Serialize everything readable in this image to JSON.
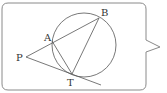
{
  "diagram": {
    "labels": {
      "A": "A",
      "B": "B",
      "P": "P",
      "T": "T"
    },
    "points": {
      "P": [
        26,
        57
      ],
      "A": [
        52,
        41
      ],
      "B": [
        99,
        18
      ],
      "T": [
        72,
        74
      ]
    },
    "circle": {
      "cx": 84,
      "cy": 45,
      "r": 32
    },
    "colors": {
      "stroke": "#555555",
      "box_border": "#888888",
      "background": "#ffffff"
    }
  }
}
